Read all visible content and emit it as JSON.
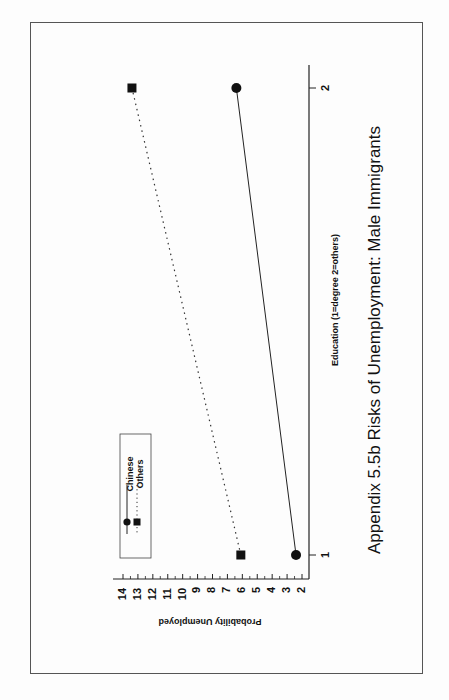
{
  "chart_data": {
    "type": "line",
    "title": "Appendix 5.5b Risks of Unemployment: Male Immigrants",
    "xlabel": "Education (1=degree 2=others)",
    "ylabel": "Probability Unemployed",
    "x": [
      1,
      2
    ],
    "x_tick_labels": [
      "1",
      "2"
    ],
    "y_tick_labels": [
      "2",
      "3",
      "4",
      "5",
      "6",
      "7",
      "8",
      "9",
      "10",
      "11",
      "12",
      "13",
      "14"
    ],
    "ylim": [
      2,
      14
    ],
    "grid": false,
    "legend_position": "upper-left (rotated page)",
    "orientation": "page rotated 90 degrees counter-clockwise",
    "series": [
      {
        "name": "Chinese",
        "marker": "circle",
        "line": "solid",
        "values": [
          2.4,
          6.4
        ]
      },
      {
        "name": "Others",
        "marker": "square",
        "line": "dotted",
        "values": [
          6.1,
          13.4
        ]
      }
    ]
  },
  "legend": {
    "items": [
      {
        "label": "Chinese"
      },
      {
        "label": "Others"
      }
    ]
  },
  "colors": {
    "ink": "#111111",
    "frame": "#555555",
    "background": "#fdfdfd"
  }
}
